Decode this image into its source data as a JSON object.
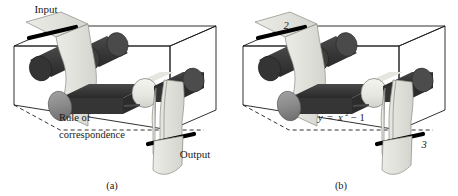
{
  "figure": {
    "type": "function-machine-diagram",
    "panels": [
      {
        "id": "a",
        "caption": "(a)",
        "input_label": "Input",
        "output_label": "Output",
        "rule_line1": "Rule of",
        "rule_line2": "correspondence",
        "input_value": "",
        "output_value": ""
      },
      {
        "id": "b",
        "caption": "(b)",
        "input_label": "",
        "output_label": "",
        "rule_equation_y": "y",
        "rule_equation_eq": "=",
        "rule_equation_x": "x",
        "rule_equation_exp": "2",
        "rule_equation_tail": "− 1",
        "input_value": "2",
        "output_value": "3"
      }
    ],
    "colors": {
      "paper": "#e2e2dd",
      "paper_edge": "#8a8a84",
      "roller_dark": "#3b3b3b",
      "roller_mid": "#8e8e8e",
      "roller_light": "#eeeeea",
      "bar": "#000000",
      "box_line": "#1a1a1a",
      "background": "#ffffff"
    }
  }
}
